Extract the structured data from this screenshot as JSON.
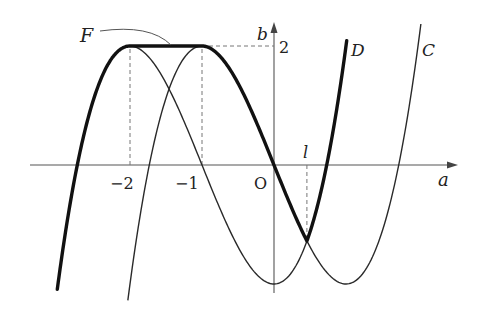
{
  "figure": {
    "axes": {
      "x_label": "a",
      "y_label": "b",
      "origin_label": "O",
      "x_ticks": [
        {
          "value": -2,
          "label": "−2"
        },
        {
          "value": -1,
          "label": "−1"
        }
      ],
      "y_ticks": [
        {
          "value": 2,
          "label": "2"
        }
      ],
      "x_range": [
        -3.4,
        2.55
      ],
      "y_range": [
        -2.2,
        2.4
      ]
    },
    "curves": [
      {
        "name": "C",
        "label": "C",
        "equation": "b = a^3 - 3a",
        "a_range": [
          -2.03,
          2.04
        ],
        "style": "thin"
      },
      {
        "name": "D",
        "label": "D",
        "equation": "b = a^3 + 3a^2 - 2",
        "a_range": [
          -3.01,
          1.01
        ],
        "style": "thin"
      }
    ],
    "path_F": {
      "label": "F",
      "pieces": [
        {
          "curve": "D",
          "a_from": -3.01,
          "a_to": -2
        },
        {
          "constant": 2,
          "a_from": -2,
          "a_to": -1
        },
        {
          "curve": "C",
          "a_from": -1,
          "a_to": 0.457
        },
        {
          "curve": "D",
          "a_from": 0.457,
          "a_to": 1.01
        }
      ],
      "style": "bold"
    },
    "special_points": {
      "l": {
        "label": "l",
        "a": 0.457,
        "note": "a-coordinate of intersection of C and D"
      }
    },
    "dashed_guides": [
      {
        "type": "vertical",
        "a": -2,
        "b_from": 0,
        "b_to": 2
      },
      {
        "type": "vertical",
        "a": -1,
        "b_from": 0,
        "b_to": 2
      },
      {
        "type": "horizontal",
        "b": 2,
        "a_from": -1,
        "a_to": 0
      },
      {
        "type": "vertical",
        "a": 0.457,
        "b_from": 0,
        "b_to": -1.28
      }
    ]
  }
}
